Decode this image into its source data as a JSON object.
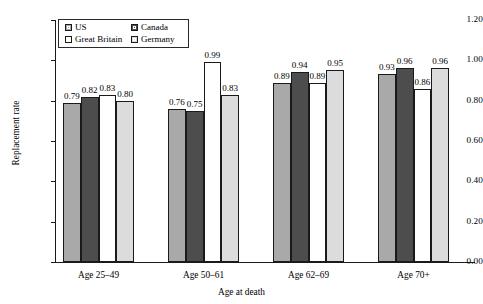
{
  "chart_data": {
    "type": "bar",
    "title": "",
    "subtitle": "",
    "xlabel": "Age at death",
    "ylabel": "Replacement rate",
    "categories": [
      "Age 25–49",
      "Age 50–61",
      "Age 62–69",
      "Age 70+"
    ],
    "series": [
      {
        "name": "US",
        "color": "#a9a9a9",
        "values": [
          0.79,
          0.76,
          0.89,
          0.93
        ],
        "labels": [
          "0.79",
          "0.76",
          "0.89",
          "0.93"
        ]
      },
      {
        "name": "Canada",
        "color": "#4d4d4d",
        "values": [
          0.82,
          0.75,
          0.94,
          0.96
        ],
        "labels": [
          "0.82",
          "0.75",
          "0.94",
          "0.96"
        ]
      },
      {
        "name": "Great Britain",
        "color": "#ffffff",
        "values": [
          0.83,
          0.99,
          0.89,
          0.86
        ],
        "labels": [
          "0.83",
          "0.99",
          "0.89",
          "0.86"
        ]
      },
      {
        "name": "Germany",
        "color": "#dcdcdc",
        "values": [
          0.8,
          0.83,
          0.95,
          0.96
        ],
        "labels": [
          "0.80",
          "0.83",
          "0.95",
          "0.96"
        ]
      }
    ],
    "ylim": [
      0.0,
      1.2
    ],
    "ytick_values": [
      0.0,
      0.2,
      0.4,
      0.6,
      0.8,
      1.0,
      1.2
    ],
    "ytick_labels": [
      "0.00",
      "0.20",
      "0.40",
      "0.60",
      "0.80",
      "1.00",
      "1.20"
    ],
    "grid": false,
    "legend_position": "top-left",
    "axis_color": "#1a1a1a",
    "bar_edge_color": "#1a1a1a",
    "background": "#ffffff"
  },
  "legend": {
    "entries": [
      {
        "label": "US",
        "swatch": "legend-swatch-us"
      },
      {
        "label": "Canada",
        "swatch": "legend-swatch-canada"
      },
      {
        "label": "Great Britain",
        "swatch": "legend-swatch-great-britain"
      },
      {
        "label": "Germany",
        "swatch": "legend-swatch-germany"
      }
    ]
  }
}
